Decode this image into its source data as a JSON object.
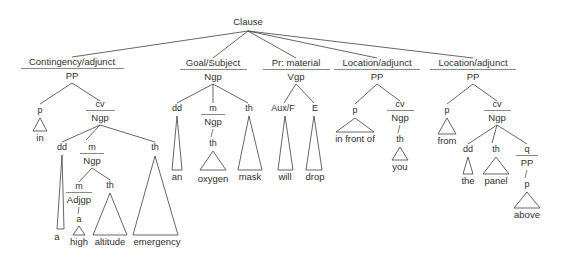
{
  "diagram": {
    "type": "syntax-tree",
    "root": "Clause",
    "sentence": "in a high altitude emergency an oxygen mask will drop in front of you from the panel above",
    "colors": {
      "background": "#ffffff",
      "line": "#3f3f3f",
      "text": "#2f2f2f",
      "rule": "#6b6b6b"
    },
    "root_label": "Clause",
    "functions": [
      {
        "label": "Contingency/adjunct",
        "category": "PP"
      },
      {
        "label": "Goal/Subject",
        "category": "Ngp"
      },
      {
        "label": "Pr: material",
        "category": "Vgp"
      },
      {
        "label": "Location/adjunct",
        "category": "PP"
      },
      {
        "label": "Location/adjunct",
        "category": "PP"
      }
    ],
    "nodes": {
      "p": "p",
      "cv": "cv",
      "ngp": "Ngp",
      "dd": "dd",
      "m": "m",
      "th": "th",
      "adjgp": "Adjgp",
      "a_node": "a",
      "aux_f": "Aux/F",
      "e": "E",
      "q": "q",
      "pp": "PP"
    },
    "leaves": {
      "in": "in",
      "a": "a",
      "high": "high",
      "altitude": "altitude",
      "emergency": "emergency",
      "an": "an",
      "oxygen": "oxygen",
      "mask": "mask",
      "will": "will",
      "drop": "drop",
      "in_front_of": "in front of",
      "you": "you",
      "from": "from",
      "the": "the",
      "panel": "panel",
      "above": "above"
    }
  }
}
